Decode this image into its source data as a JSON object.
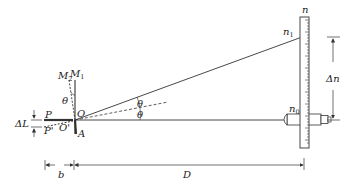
{
  "diagram": {
    "type": "optical-lever-measurement",
    "labels": {
      "P": "P",
      "P_prime": "P'",
      "O": "O",
      "O_prime": "O'",
      "A": "A",
      "M2": "M",
      "M2_sub": "2",
      "M1": "M",
      "M1_sub": "1",
      "theta_mirror": "θ",
      "theta_upper": "θ",
      "theta_lower": "θ",
      "delta_L": "ΔL",
      "b": "b",
      "D": "D",
      "n": "n",
      "n1": "n",
      "n1_sub": "1",
      "n0": "n",
      "n0_sub": "0",
      "delta_n": "Δn"
    },
    "colors": {
      "line": "#333333",
      "scale_fill": "#ffffff"
    }
  }
}
